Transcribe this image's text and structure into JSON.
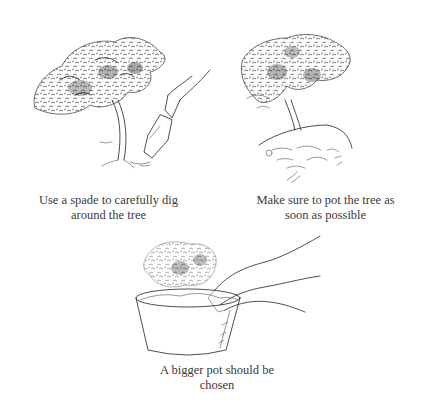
{
  "figure": {
    "panels": [
      {
        "id": "dig",
        "illustration": "tree-with-spade-icon",
        "caption_line1": "Use a spade to carefully dig",
        "caption_line2": "around the tree"
      },
      {
        "id": "pot-soon",
        "illustration": "tree-on-soil-mound-icon",
        "caption_line1": "Make sure to pot the tree as",
        "caption_line2": "soon as possible"
      },
      {
        "id": "bigger-pot",
        "illustration": "hand-placing-tree-in-pot-icon",
        "caption_line1": "A bigger pot should be",
        "caption_line2": "chosen"
      }
    ],
    "colors": {
      "background": "#ffffff",
      "ink": "#222222",
      "caption_text": "#3a3a3a"
    }
  }
}
